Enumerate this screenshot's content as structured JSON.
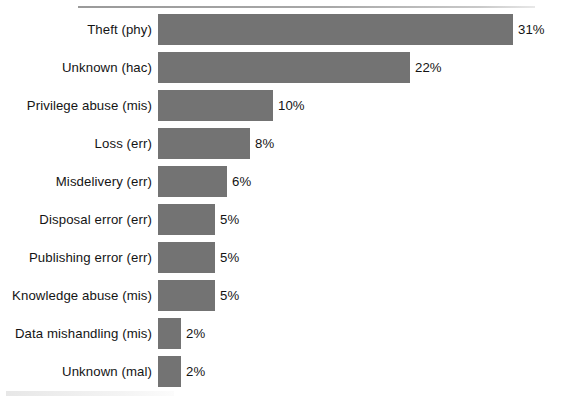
{
  "chart_data": {
    "type": "bar",
    "orientation": "horizontal",
    "title": "",
    "subtitle": "",
    "xlabel": "",
    "ylabel": "",
    "grid": false,
    "legend": null,
    "axis_visible": false,
    "value_suffix": "%",
    "xlim": [
      0,
      31
    ],
    "bar_color": "#737373",
    "text_color": "#141414",
    "rule_color": "#a8a8a8",
    "categories": [
      "Theft (phy)",
      "Unknown (hac)",
      "Privilege abuse (mis)",
      "Loss (err)",
      "Misdelivery (err)",
      "Disposal error (err)",
      "Publishing error (err)",
      "Knowledge abuse (mis)",
      "Data mishandling (mis)",
      "Unknown (mal)"
    ],
    "values": [
      31,
      22,
      10,
      8,
      6,
      5,
      5,
      5,
      2,
      2
    ],
    "value_labels": [
      "31%",
      "22%",
      "10%",
      "8%",
      "6%",
      "5%",
      "5%",
      "5%",
      "2%",
      "2%"
    ],
    "bars": [
      {
        "label": "Theft (phy)",
        "value": 31,
        "value_label": "31%"
      },
      {
        "label": "Unknown (hac)",
        "value": 22,
        "value_label": "22%"
      },
      {
        "label": "Privilege abuse (mis)",
        "value": 10,
        "value_label": "10%"
      },
      {
        "label": "Loss (err)",
        "value": 8,
        "value_label": "8%"
      },
      {
        "label": "Misdelivery (err)",
        "value": 6,
        "value_label": "6%"
      },
      {
        "label": "Disposal error (err)",
        "value": 5,
        "value_label": "5%"
      },
      {
        "label": "Publishing error (err)",
        "value": 5,
        "value_label": "5%"
      },
      {
        "label": "Knowledge abuse (mis)",
        "value": 5,
        "value_label": "5%"
      },
      {
        "label": "Data mishandling (mis)",
        "value": 2,
        "value_label": "2%"
      },
      {
        "label": "Unknown (mal)",
        "value": 2,
        "value_label": "2%"
      }
    ]
  }
}
